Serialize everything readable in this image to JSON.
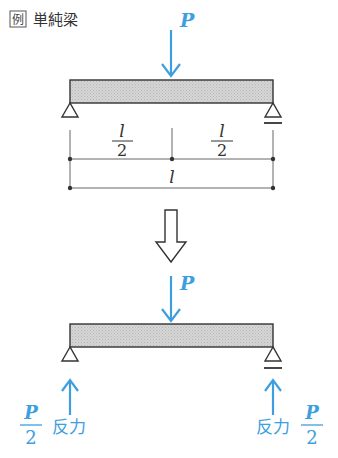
{
  "title": {
    "badge": "例",
    "text": "単純梁"
  },
  "top_diagram": {
    "load_label": "P",
    "dimensions": {
      "half_left": {
        "numerator": "l",
        "denominator": "2"
      },
      "half_right": {
        "numerator": "l",
        "denominator": "2"
      },
      "total": "l"
    },
    "supports": [
      "pin",
      "roller"
    ]
  },
  "transition_arrow": "down-hollow-arrow",
  "bottom_diagram": {
    "load_label": "P",
    "reactions": [
      {
        "side": "left",
        "numerator": "P",
        "denominator": "2",
        "label": "反力"
      },
      {
        "side": "right",
        "numerator": "P",
        "denominator": "2",
        "label": "反力"
      }
    ]
  },
  "colors": {
    "accent": "#3d9ee0",
    "beam_fill": "#cfcfcf",
    "line": "#333333"
  }
}
